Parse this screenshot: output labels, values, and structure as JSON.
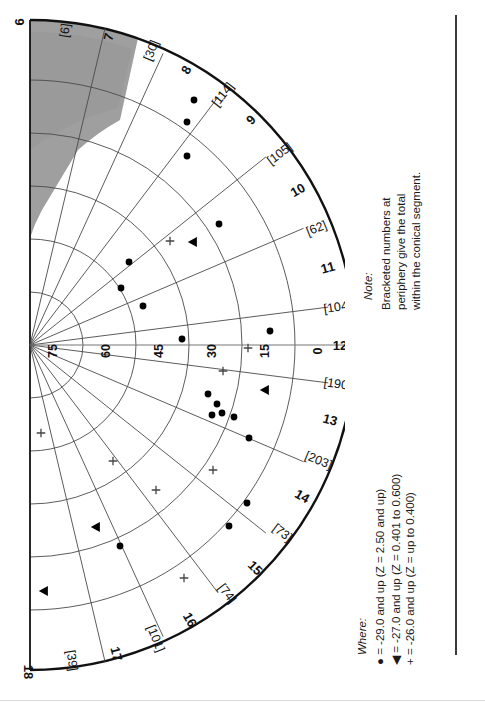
{
  "figure": {
    "type": "polar-rose-scatter",
    "orientation": "rotated-90-ccw"
  },
  "note": {
    "title": "Note:",
    "lines": [
      "Bracketed numbers at",
      "periphery give the total",
      "within the conical segment."
    ]
  },
  "legend": {
    "title": "Where:",
    "entries": [
      {
        "symbol": "●",
        "symbol_name": "filled-circle",
        "text": "= -29.0 and up (Z = 2.50 and up)"
      },
      {
        "symbol": "◀",
        "symbol_name": "filled-triangle",
        "text": "= -27.0 and up (Z = 0.401 to 0.600)"
      },
      {
        "symbol": "+",
        "symbol_name": "plus-sign",
        "text": "= -26.0 and up (Z = up to 0.400)"
      }
    ]
  },
  "chart_data": {
    "type": "scatter",
    "title": "",
    "xlabel": "",
    "ylabel": "",
    "grid": true,
    "legend_position": "bottom-right",
    "radial_axis": {
      "label": "",
      "ticks": [
        75,
        60,
        45,
        30,
        15,
        0
      ],
      "tick_labels": [
        "75",
        "60",
        "45",
        "30",
        "15",
        "0"
      ],
      "range": [
        0,
        90
      ]
    },
    "angular_axis": {
      "label": "",
      "sector_labels": [
        "6",
        "7",
        "8",
        "9",
        "10",
        "11",
        "12",
        "13",
        "14",
        "15",
        "16",
        "17",
        "18"
      ],
      "bracket_labels": [
        "[6]",
        "[30]",
        "[114]",
        "[105]",
        "[62]",
        "[104]",
        "[190]",
        "[203]",
        "[73]",
        "[74]",
        "[101]",
        "[39]"
      ],
      "bracket_values": [
        6,
        30,
        114,
        105,
        62,
        104,
        190,
        203,
        73,
        74,
        101,
        39
      ]
    },
    "series": [
      {
        "name": "-29.0 and up (Z = 2.50 and up)",
        "marker": "filled-circle",
        "points": [
          {
            "x": 194,
            "y": 100
          },
          {
            "x": 187,
            "y": 122
          },
          {
            "x": 187,
            "y": 156
          },
          {
            "x": 219,
            "y": 224
          },
          {
            "x": 129,
            "y": 262
          },
          {
            "x": 121,
            "y": 288
          },
          {
            "x": 143,
            "y": 306
          },
          {
            "x": 182,
            "y": 339
          },
          {
            "x": 270,
            "y": 331
          },
          {
            "x": 208,
            "y": 394
          },
          {
            "x": 217,
            "y": 404
          },
          {
            "x": 212,
            "y": 415
          },
          {
            "x": 222,
            "y": 413
          },
          {
            "x": 234,
            "y": 417
          },
          {
            "x": 249,
            "y": 438
          },
          {
            "x": 247,
            "y": 503
          },
          {
            "x": 229,
            "y": 526
          },
          {
            "x": 120,
            "y": 546
          }
        ]
      },
      {
        "name": "-27.0 and up (Z = 0.401 to 0.600)",
        "marker": "filled-triangle",
        "points": [
          {
            "x": 193,
            "y": 242
          },
          {
            "x": 265,
            "y": 390
          },
          {
            "x": 96,
            "y": 527
          },
          {
            "x": 44,
            "y": 591
          }
        ]
      },
      {
        "name": "-26.0 and up (Z = up to 0.400)",
        "marker": "plus-sign",
        "points": [
          {
            "x": 170,
            "y": 241
          },
          {
            "x": 248,
            "y": 348
          },
          {
            "x": 223,
            "y": 371
          },
          {
            "x": 41,
            "y": 433
          },
          {
            "x": 113,
            "y": 461
          },
          {
            "x": 156,
            "y": 490
          },
          {
            "x": 213,
            "y": 470
          },
          {
            "x": 184,
            "y": 578
          }
        ]
      }
    ]
  }
}
